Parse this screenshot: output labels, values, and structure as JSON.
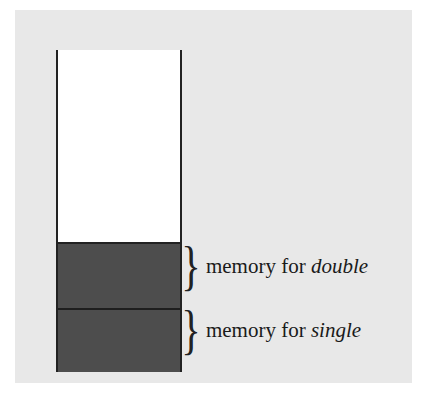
{
  "diagram": {
    "type": "memory-stack",
    "segments": [
      {
        "id": "double",
        "label_prefix": "memory for ",
        "label_type": "double",
        "fill": "#4d4d4d"
      },
      {
        "id": "single",
        "label_prefix": "memory for ",
        "label_type": "single",
        "fill": "#4d4d4d"
      }
    ],
    "free_region_fill": "#ffffff",
    "background": "#e8e8e8",
    "brace_glyph": "}"
  }
}
